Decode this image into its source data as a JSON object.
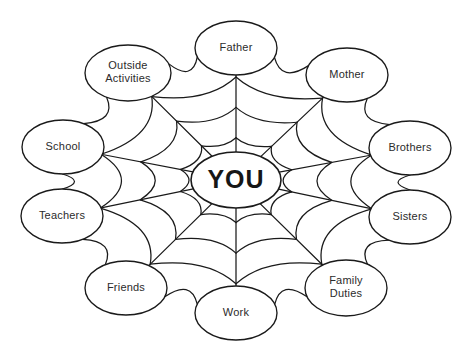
{
  "diagram": {
    "title": "YOU",
    "center": {
      "label": "YOU",
      "cx": 236,
      "cy": 180,
      "rx": 45,
      "ry": 28
    },
    "geometry": {
      "cx": 236,
      "cy": 180,
      "node_rx": 39,
      "node_ry": 26,
      "ring_count": 3,
      "ring_fractions": [
        0.32,
        0.55,
        0.78
      ],
      "sag": 0.17,
      "stroke_color": "#1a1a1a",
      "background_color": "#ffffff"
    },
    "nodes": [
      {
        "id": "father",
        "label": "Father",
        "lines": [
          "Father"
        ],
        "cx": 236,
        "cy": 48,
        "rx": 41,
        "ry": 27
      },
      {
        "id": "mother",
        "label": "Mother",
        "lines": [
          "Mother"
        ],
        "cx": 347,
        "cy": 75,
        "rx": 41,
        "ry": 27
      },
      {
        "id": "brothers",
        "label": "Brothers",
        "lines": [
          "Brothers"
        ],
        "cx": 410,
        "cy": 148,
        "rx": 41,
        "ry": 27
      },
      {
        "id": "sisters",
        "label": "Sisters",
        "lines": [
          "Sisters"
        ],
        "cx": 410,
        "cy": 217,
        "rx": 41,
        "ry": 27
      },
      {
        "id": "family-duties",
        "label": "Family Duties",
        "lines": [
          "Family",
          "Duties"
        ],
        "cx": 346,
        "cy": 288,
        "rx": 41,
        "ry": 28
      },
      {
        "id": "work",
        "label": "Work",
        "lines": [
          "Work"
        ],
        "cx": 236,
        "cy": 313,
        "rx": 41,
        "ry": 27
      },
      {
        "id": "friends",
        "label": "Friends",
        "lines": [
          "Friends"
        ],
        "cx": 126,
        "cy": 288,
        "rx": 41,
        "ry": 27
      },
      {
        "id": "teachers",
        "label": "Teachers",
        "lines": [
          "Teachers"
        ],
        "cx": 62,
        "cy": 216,
        "rx": 41,
        "ry": 27
      },
      {
        "id": "school",
        "label": "School",
        "lines": [
          "School"
        ],
        "cx": 63,
        "cy": 147,
        "rx": 41,
        "ry": 27
      },
      {
        "id": "outside-activities",
        "label": "Outside Activities",
        "lines": [
          "Outside",
          "Activities"
        ],
        "cx": 128,
        "cy": 73,
        "rx": 43,
        "ry": 28
      }
    ]
  }
}
